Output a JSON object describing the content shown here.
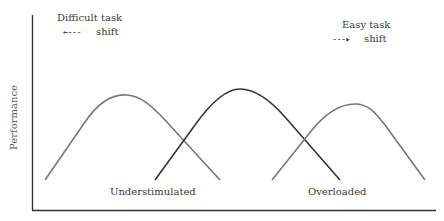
{
  "diagram": {
    "y_axis_label": "Performance",
    "top_left": {
      "title": "Difficult task",
      "arrow": "←---",
      "subtitle": "shift",
      "direction": "left"
    },
    "top_right": {
      "title": "Easy task",
      "arrow": "---▸",
      "subtitle": "shift",
      "direction": "right"
    },
    "region_labels": {
      "left": "Understimulated",
      "right": "Overloaded"
    },
    "curves": [
      {
        "name": "difficult-task-curve",
        "color": "#777777",
        "start": [
          45,
          180
        ],
        "peak": [
          127,
          95
        ],
        "end": [
          220,
          180
        ]
      },
      {
        "name": "baseline-curve",
        "color": "#333333",
        "start": [
          155,
          180
        ],
        "peak": [
          240,
          89
        ],
        "end": [
          340,
          180
        ]
      },
      {
        "name": "easy-task-curve",
        "color": "#777777",
        "start": [
          272,
          180
        ],
        "peak": [
          357,
          104
        ],
        "end": [
          425,
          180
        ]
      }
    ],
    "colors": {
      "axis": "#333333",
      "text": "#3a3a3a"
    }
  }
}
